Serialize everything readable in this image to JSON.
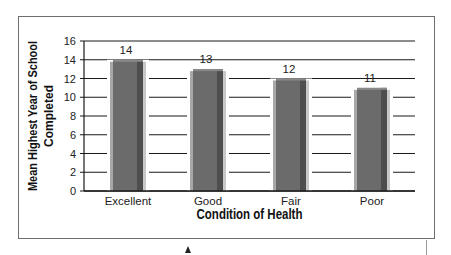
{
  "chart_data": {
    "type": "bar",
    "title": "",
    "categories": [
      "Excellent",
      "Good",
      "Fair",
      "Poor"
    ],
    "values": [
      14,
      13,
      12,
      11
    ],
    "data_labels": [
      "14",
      "13",
      "12",
      "11"
    ],
    "xlabel": "Condition of Health",
    "ylabel": "Mean Highest Year of School Completed",
    "ylabel_lines": [
      "Mean Highest Year of School",
      "Completed"
    ],
    "ylim": [
      0,
      16
    ],
    "yticks": [
      0,
      2,
      4,
      6,
      8,
      10,
      12,
      14,
      16
    ],
    "grid": true,
    "legend": null,
    "bar_color": "#6b6b6b"
  },
  "colors": {
    "bar_face": "#6b6b6b",
    "bar_shade": "#4e4e4e",
    "bar_highlight": "#a8a8a8",
    "grid": "#1a1a1a",
    "frame": "#6e6e6e"
  }
}
